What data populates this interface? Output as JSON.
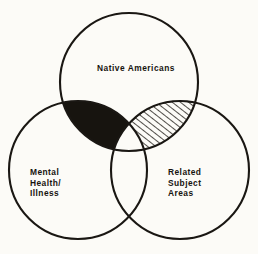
{
  "figure": {
    "type": "venn-diagram",
    "set_count": 3,
    "background_color": "#fcfbf7",
    "ink_color": "#17140f"
  },
  "sets": [
    {
      "id": "native-americans",
      "label": "Native Americans",
      "position": "top",
      "center": [
        129,
        82
      ],
      "radius": 69
    },
    {
      "id": "mental-health-illness",
      "label": "Mental\nHealth/\nIllness",
      "position": "bottom-left",
      "center": [
        78,
        170
      ],
      "radius": 69
    },
    {
      "id": "related-subject-areas",
      "label": "Related\nSubject\nAreas",
      "position": "bottom-right",
      "center": [
        180,
        170
      ],
      "radius": 69
    }
  ],
  "regions": [
    {
      "id": "native-x-mental",
      "sets": [
        "native-americans",
        "mental-health-illness"
      ],
      "fill": "solid-black",
      "fill_color": "#17140f"
    },
    {
      "id": "native-x-related",
      "sets": [
        "native-americans",
        "related-subject-areas"
      ],
      "fill": "diagonal-hatch",
      "fill_color": "#fcfbf7",
      "hatch_color": "#17140f"
    },
    {
      "id": "mental-x-related",
      "sets": [
        "mental-health-illness",
        "related-subject-areas"
      ],
      "fill": "none",
      "fill_color": "#fcfbf7"
    },
    {
      "id": "all-three",
      "sets": [
        "native-americans",
        "mental-health-illness",
        "related-subject-areas"
      ],
      "fill": "none",
      "fill_color": "#fcfbf7"
    }
  ]
}
